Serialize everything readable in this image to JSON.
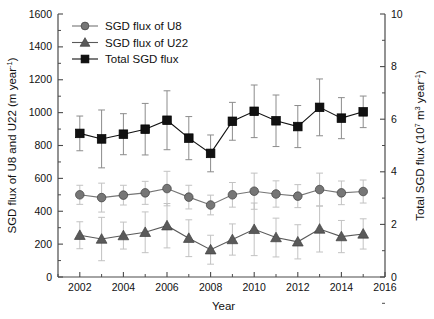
{
  "chart_data": {
    "type": "line",
    "title": "",
    "xlabel": "Year",
    "ylabel": "SGD flux of U8 and U22 (m year-1)",
    "ylabel_right": "Total SGD flux (107 m3 year-1)",
    "x": [
      2002,
      2003,
      2004,
      2005,
      2006,
      2007,
      2008,
      2009,
      2010,
      2011,
      2012,
      2013,
      2014,
      2015
    ],
    "xlim": [
      2001,
      2016
    ],
    "xticks": [
      2002,
      2004,
      2006,
      2008,
      2010,
      2012,
      2014,
      2016
    ],
    "ylim": [
      0,
      1600
    ],
    "yticks": [
      0,
      200,
      400,
      600,
      800,
      1000,
      1200,
      1400,
      1600
    ],
    "ylim_right": [
      0,
      10
    ],
    "yticks_right": [
      0,
      2,
      4,
      6,
      8,
      10
    ],
    "grid": false,
    "legend_position": "top-left",
    "series": [
      {
        "name": "SGD flux of U8",
        "marker": "circle",
        "color": "#767676",
        "axis": "left",
        "values": [
          500,
          483,
          498,
          512,
          538,
          486,
          438,
          500,
          522,
          505,
          492,
          532,
          512,
          520
        ],
        "err_lo": [
          58,
          88,
          60,
          70,
          105,
          72,
          60,
          75,
          110,
          80,
          70,
          100,
          72,
          70
        ],
        "err_hi": [
          58,
          88,
          60,
          70,
          105,
          72,
          60,
          75,
          110,
          80,
          70,
          100,
          72,
          70
        ]
      },
      {
        "name": "SGD flux of  U22",
        "marker": "triangle",
        "color": "#5a5a5a",
        "axis": "left",
        "values": [
          254,
          231,
          252,
          272,
          312,
          236,
          166,
          228,
          290,
          240,
          214,
          292,
          246,
          262
        ],
        "err_lo": [
          82,
          132,
          82,
          124,
          135,
          112,
          88,
          95,
          160,
          118,
          104,
          140,
          98,
          92
        ],
        "err_hi": [
          82,
          132,
          82,
          124,
          135,
          112,
          88,
          95,
          160,
          118,
          104,
          140,
          98,
          92
        ]
      },
      {
        "name": "Total SGD flux",
        "marker": "square",
        "color": "#111111",
        "axis": "right",
        "values": [
          5.46,
          5.25,
          5.43,
          5.62,
          5.96,
          5.28,
          4.7,
          5.92,
          6.3,
          5.94,
          5.72,
          6.45,
          6.04,
          6.28
        ],
        "err_lo": [
          0.66,
          1.1,
          0.78,
          0.98,
          1.12,
          0.82,
          0.7,
          0.72,
          1.0,
          0.98,
          0.8,
          1.08,
          0.78,
          0.6
        ],
        "err_hi": [
          0.66,
          1.1,
          0.78,
          0.98,
          1.12,
          0.82,
          0.7,
          0.72,
          1.0,
          0.98,
          0.8,
          1.08,
          0.78,
          0.6
        ]
      }
    ],
    "legend": [
      {
        "label": "SGD flux of U8",
        "marker": "circle",
        "color": "#767676"
      },
      {
        "label": "SGD flux of  U22",
        "marker": "triangle",
        "color": "#5a5a5a"
      },
      {
        "label": "Total SGD flux",
        "marker": "square",
        "color": "#111111"
      }
    ],
    "axis_label_parts": {
      "left_pre": "SGD flux of U8 and U22 (m year",
      "left_sup": "-1",
      "left_post": ")",
      "right_pre": "Total SGD flux (10",
      "right_sup1": "7",
      "right_mid": " m",
      "right_sup2": "3",
      "right_mid2": " year",
      "right_sup3": "-1",
      "right_post": ")"
    }
  }
}
